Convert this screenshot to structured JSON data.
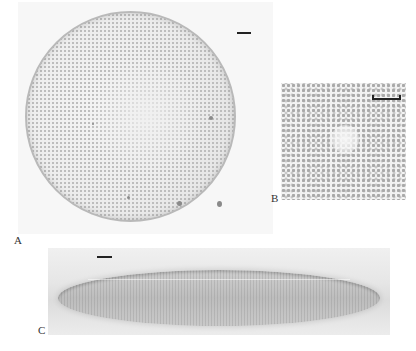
{
  "figure": {
    "panels": [
      {
        "id": "A",
        "label": "A",
        "content": "circular valve, light micrograph",
        "scale_bar": true
      },
      {
        "id": "B",
        "label": "B",
        "content": "detail of areolae near valve center",
        "scale_bar": true
      },
      {
        "id": "C",
        "label": "C",
        "content": "girdle/side view of frustule",
        "scale_bar": true
      }
    ]
  },
  "labels": {
    "a": "A",
    "b": "B",
    "c": "C"
  }
}
